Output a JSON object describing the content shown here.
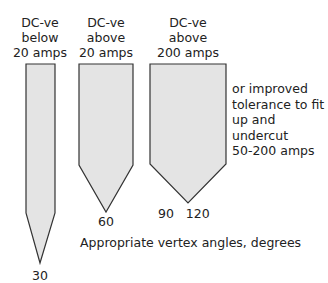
{
  "electrodes": [
    {
      "label_lines": [
        "DC-ve",
        "below",
        "20 amps"
      ],
      "vertex_angle": "30"
    },
    {
      "label_lines": [
        "DC-ve",
        "above",
        "20 amps"
      ],
      "vertex_angle": "60"
    },
    {
      "label_lines": [
        "DC-ve",
        "above",
        "200 amps"
      ],
      "vertex_angles": "90   120"
    }
  ],
  "side_note": [
    "or improved",
    "tolerance to fit",
    "up and undercut",
    "50-200 amps"
  ],
  "caption": "Appropriate vertex angles, degrees",
  "colors": {
    "fill": "#e4e4e4",
    "stroke": "#333333"
  }
}
